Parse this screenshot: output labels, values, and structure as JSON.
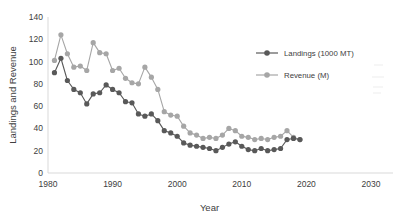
{
  "chart_data": {
    "type": "line",
    "title": "",
    "xlabel": "Year",
    "ylabel": "Landings and Revenue",
    "xlim": [
      1980,
      2030
    ],
    "ylim": [
      0,
      140
    ],
    "xticks": [
      1980,
      1990,
      2000,
      2010,
      2020,
      2030
    ],
    "yticks": [
      0,
      20,
      40,
      60,
      80,
      100,
      120,
      140
    ],
    "grid": false,
    "legend_position": "right-top",
    "x": [
      1981,
      1982,
      1983,
      1984,
      1985,
      1986,
      1987,
      1988,
      1989,
      1990,
      1991,
      1992,
      1993,
      1994,
      1995,
      1996,
      1997,
      1998,
      1999,
      2000,
      2001,
      2002,
      2003,
      2004,
      2005,
      2006,
      2007,
      2008,
      2009,
      2010,
      2011,
      2012,
      2013,
      2014,
      2015,
      2016,
      2017,
      2018,
      2019
    ],
    "series": [
      {
        "name": "Landings (1000 MT)",
        "color": "#595959",
        "values": [
          90,
          103,
          83,
          75,
          72,
          62,
          71,
          72,
          79,
          75,
          72,
          64,
          63,
          53,
          51,
          53,
          47,
          38,
          36,
          33,
          27,
          25,
          24,
          23,
          22,
          20,
          23,
          26,
          28,
          24,
          21,
          20,
          22,
          20,
          21,
          22,
          30,
          31,
          30
        ]
      },
      {
        "name": "Revenue (M)",
        "color": "#a6a6a6",
        "values": [
          101,
          124,
          107,
          95,
          96,
          92,
          117,
          108,
          107,
          92,
          94,
          85,
          81,
          80,
          95,
          86,
          75,
          55,
          52,
          51,
          42,
          36,
          34,
          31,
          32,
          31,
          34,
          40,
          38,
          33,
          32,
          30,
          31,
          30,
          32,
          33,
          38,
          32,
          30
        ]
      }
    ],
    "legend": [
      {
        "label": "Landings (1000 MT)",
        "color": "#595959"
      },
      {
        "label": "Revenue (M)",
        "color": "#a6a6a6"
      }
    ]
  },
  "axis": {
    "ylabel": "Landings and Revenue",
    "xlabel": "Year",
    "yticks": [
      "140",
      "120",
      "100",
      "80",
      "60",
      "40",
      "20",
      "0"
    ],
    "xticks": [
      "1980",
      "1990",
      "2000",
      "2010",
      "2020",
      "2030"
    ]
  },
  "cropped_title_fragment": "••"
}
